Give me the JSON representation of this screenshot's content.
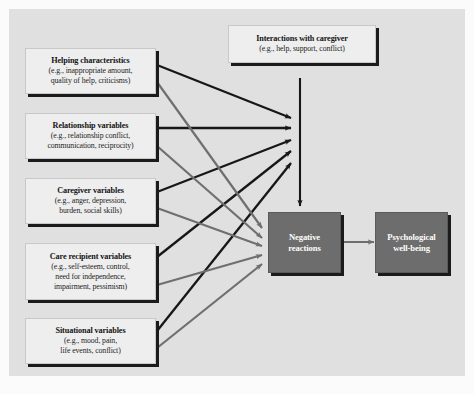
{
  "figure": {
    "type": "path-model-diagram",
    "panel_bg": "#e0e0e0",
    "page_bg": "#fbfbfb",
    "dark_node_color": "#6d6d6d",
    "light_node_color": "#eeeeee",
    "dark_arrow_color": "#171717",
    "gray_arrow_color": "#6f6f6f"
  },
  "nodes": {
    "interactions": {
      "title": "Interactions with caregiver",
      "sub": "(e.g., help, support, conflict)"
    },
    "helping": {
      "title": "Helping characteristics",
      "sub_line1": "(e.g., inappropriate amount,",
      "sub_line2": "quality of help, criticisms)"
    },
    "relationship": {
      "title": "Relationship variables",
      "sub_line1": "(e.g., relationship conflict,",
      "sub_line2": "communication, reciprocity)"
    },
    "caregiver": {
      "title": "Caregiver variables",
      "sub_line1": "(e.g., anger, depression,",
      "sub_line2": "burden, social skills)"
    },
    "care_recipient": {
      "title": "Care recipient variables",
      "sub_line1": "(e.g., self-esteem, control,",
      "sub_line2": "need for independence,",
      "sub_line3": "impairment, pessimism)"
    },
    "situational": {
      "title": "Situational variables",
      "sub_line1": "(e.g., mood, pain,",
      "sub_line2": "life events, conflict)"
    },
    "negative_reactions": {
      "line1": "Negative",
      "line2": "reactions"
    },
    "wellbeing": {
      "line1": "Psychological",
      "line2": "well-being"
    }
  },
  "edges": [
    {
      "from": "helping",
      "to": "interactions-path",
      "style": "dark"
    },
    {
      "from": "relationship",
      "to": "interactions-path",
      "style": "dark"
    },
    {
      "from": "caregiver",
      "to": "interactions-path",
      "style": "dark"
    },
    {
      "from": "care_recipient",
      "to": "interactions-path",
      "style": "dark"
    },
    {
      "from": "situational",
      "to": "interactions-path",
      "style": "dark"
    },
    {
      "from": "helping",
      "to": "negative_reactions",
      "style": "gray"
    },
    {
      "from": "relationship",
      "to": "negative_reactions",
      "style": "gray"
    },
    {
      "from": "caregiver",
      "to": "negative_reactions",
      "style": "gray"
    },
    {
      "from": "care_recipient",
      "to": "negative_reactions",
      "style": "gray"
    },
    {
      "from": "situational",
      "to": "negative_reactions",
      "style": "gray"
    },
    {
      "from": "interactions",
      "to": "negative_reactions",
      "style": "dark"
    },
    {
      "from": "negative_reactions",
      "to": "wellbeing",
      "style": "gray"
    }
  ]
}
